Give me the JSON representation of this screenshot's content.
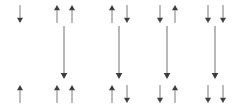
{
  "diagram": {
    "type": "arrow-diagram",
    "width": 246,
    "height": 108,
    "background_color": "#ffffff",
    "shaft_color": "#878787",
    "head_color": "#3c3c3c",
    "shaft_width": 1.1,
    "long_shaft_width": 1.2,
    "rows": {
      "top_row_label": "top",
      "bottom_row_label": "bottom",
      "middle_row_label": "middle"
    },
    "groups": [
      {
        "id": "group-1",
        "index": 1,
        "center_x": 20,
        "top_arrows": [
          {
            "id": "g1-top-1",
            "x": 20,
            "direction": "down",
            "y_start": 5,
            "y_end": 23
          }
        ],
        "bottom_arrows": [
          {
            "id": "g1-bottom-1",
            "x": 20,
            "direction": "up",
            "y_start": 103,
            "y_end": 85
          }
        ],
        "long_arrow": null
      },
      {
        "id": "group-2",
        "index": 2,
        "center_x": 64,
        "top_arrows": [
          {
            "id": "g2-top-1",
            "x": 57,
            "direction": "up",
            "y_start": 23,
            "y_end": 5
          },
          {
            "id": "g2-top-2",
            "x": 72,
            "direction": "up",
            "y_start": 23,
            "y_end": 5
          }
        ],
        "bottom_arrows": [
          {
            "id": "g2-bottom-1",
            "x": 57,
            "direction": "up",
            "y_start": 103,
            "y_end": 85
          },
          {
            "id": "g2-bottom-2",
            "x": 72,
            "direction": "up",
            "y_start": 103,
            "y_end": 85
          }
        ],
        "long_arrow": {
          "id": "g2-long",
          "x": 64,
          "direction": "down",
          "y_start": 26,
          "y_end": 79
        }
      },
      {
        "id": "group-3",
        "index": 3,
        "center_x": 119,
        "top_arrows": [
          {
            "id": "g3-top-1",
            "x": 112,
            "direction": "up",
            "y_start": 23,
            "y_end": 5
          },
          {
            "id": "g3-top-2",
            "x": 127,
            "direction": "down",
            "y_start": 5,
            "y_end": 23
          }
        ],
        "bottom_arrows": [
          {
            "id": "g3-bottom-1",
            "x": 112,
            "direction": "up",
            "y_start": 103,
            "y_end": 85
          },
          {
            "id": "g3-bottom-2",
            "x": 127,
            "direction": "down",
            "y_start": 85,
            "y_end": 103
          }
        ],
        "long_arrow": {
          "id": "g3-long",
          "x": 119,
          "direction": "down",
          "y_start": 26,
          "y_end": 79
        }
      },
      {
        "id": "group-4",
        "index": 4,
        "center_x": 167,
        "top_arrows": [
          {
            "id": "g4-top-1",
            "x": 160,
            "direction": "down",
            "y_start": 5,
            "y_end": 23
          },
          {
            "id": "g4-top-2",
            "x": 175,
            "direction": "up",
            "y_start": 23,
            "y_end": 5
          }
        ],
        "bottom_arrows": [
          {
            "id": "g4-bottom-1",
            "x": 160,
            "direction": "down",
            "y_start": 85,
            "y_end": 103
          },
          {
            "id": "g4-bottom-2",
            "x": 175,
            "direction": "up",
            "y_start": 103,
            "y_end": 85
          }
        ],
        "long_arrow": {
          "id": "g4-long",
          "x": 167,
          "direction": "down",
          "y_start": 26,
          "y_end": 79
        }
      },
      {
        "id": "group-5",
        "index": 5,
        "center_x": 215,
        "top_arrows": [
          {
            "id": "g5-top-1",
            "x": 208,
            "direction": "down",
            "y_start": 5,
            "y_end": 23
          },
          {
            "id": "g5-top-2",
            "x": 223,
            "direction": "down",
            "y_start": 5,
            "y_end": 23
          }
        ],
        "bottom_arrows": [
          {
            "id": "g5-bottom-1",
            "x": 208,
            "direction": "down",
            "y_start": 85,
            "y_end": 103
          },
          {
            "id": "g5-bottom-2",
            "x": 223,
            "direction": "down",
            "y_start": 85,
            "y_end": 103
          }
        ],
        "long_arrow": {
          "id": "g5-long",
          "x": 215,
          "direction": "down",
          "y_start": 26,
          "y_end": 79
        }
      }
    ]
  }
}
